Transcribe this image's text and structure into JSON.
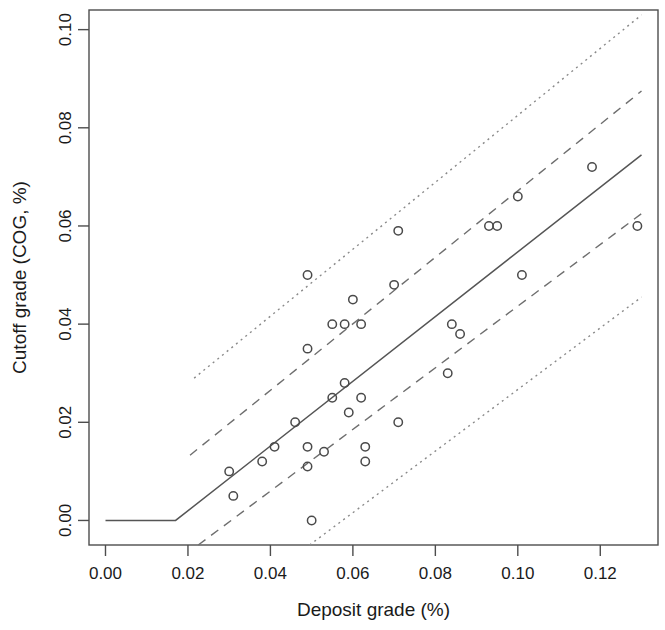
{
  "chart_data": {
    "type": "scatter",
    "title": "",
    "xlabel": "Deposit grade (%)",
    "ylabel": "Cutoff grade (COG, %)",
    "xlim": [
      -0.004,
      0.134
    ],
    "ylim": [
      -0.005,
      0.104
    ],
    "xticks": [
      0.0,
      0.02,
      0.04,
      0.06,
      0.08,
      0.1,
      0.12
    ],
    "xtick_labels": [
      "0.00",
      "0.02",
      "0.04",
      "0.06",
      "0.08",
      "0.10",
      "0.12"
    ],
    "yticks": [
      0.0,
      0.02,
      0.04,
      0.06,
      0.08,
      0.1
    ],
    "ytick_labels": [
      "0.00",
      "0.02",
      "0.04",
      "0.06",
      "0.08",
      "0.10"
    ],
    "grid": false,
    "legend": "none",
    "marker": "open-circle",
    "points": [
      {
        "x": 0.03,
        "y": 0.01
      },
      {
        "x": 0.031,
        "y": 0.005
      },
      {
        "x": 0.038,
        "y": 0.012
      },
      {
        "x": 0.041,
        "y": 0.015
      },
      {
        "x": 0.046,
        "y": 0.02
      },
      {
        "x": 0.049,
        "y": 0.05
      },
      {
        "x": 0.049,
        "y": 0.035
      },
      {
        "x": 0.049,
        "y": 0.015
      },
      {
        "x": 0.049,
        "y": 0.011
      },
      {
        "x": 0.05,
        "y": 0.0
      },
      {
        "x": 0.053,
        "y": 0.014
      },
      {
        "x": 0.055,
        "y": 0.04
      },
      {
        "x": 0.055,
        "y": 0.025
      },
      {
        "x": 0.058,
        "y": 0.04
      },
      {
        "x": 0.058,
        "y": 0.028
      },
      {
        "x": 0.059,
        "y": 0.022
      },
      {
        "x": 0.06,
        "y": 0.045
      },
      {
        "x": 0.062,
        "y": 0.04
      },
      {
        "x": 0.062,
        "y": 0.025
      },
      {
        "x": 0.063,
        "y": 0.015
      },
      {
        "x": 0.063,
        "y": 0.012
      },
      {
        "x": 0.07,
        "y": 0.048
      },
      {
        "x": 0.071,
        "y": 0.059
      },
      {
        "x": 0.071,
        "y": 0.02
      },
      {
        "x": 0.083,
        "y": 0.03
      },
      {
        "x": 0.084,
        "y": 0.04
      },
      {
        "x": 0.086,
        "y": 0.038
      },
      {
        "x": 0.093,
        "y": 0.06
      },
      {
        "x": 0.095,
        "y": 0.06
      },
      {
        "x": 0.1,
        "y": 0.066
      },
      {
        "x": 0.101,
        "y": 0.05
      },
      {
        "x": 0.118,
        "y": 0.072
      },
      {
        "x": 0.129,
        "y": 0.06
      }
    ],
    "fit_line": {
      "style": "solid",
      "label": "regression fit",
      "points": [
        {
          "x": 0.0,
          "y": 0.0
        },
        {
          "x": 0.017,
          "y": 0.0
        },
        {
          "x": 0.13,
          "y": 0.0745
        }
      ]
    },
    "confidence_band": {
      "style": "dashed",
      "label": "confidence interval",
      "upper": [
        {
          "x": 0.0205,
          "y": 0.0133
        },
        {
          "x": 0.13,
          "y": 0.0875
        }
      ],
      "lower": [
        {
          "x": 0.0225,
          "y": -0.005
        },
        {
          "x": 0.13,
          "y": 0.0625
        }
      ]
    },
    "prediction_band": {
      "style": "dotted",
      "label": "prediction interval",
      "upper": [
        {
          "x": 0.0215,
          "y": 0.029
        },
        {
          "x": 0.13,
          "y": 0.103
        }
      ],
      "lower": [
        {
          "x": 0.0495,
          "y": -0.005
        },
        {
          "x": 0.13,
          "y": 0.0455
        }
      ]
    }
  },
  "figure": {
    "background_color": "#ffffff",
    "axis_color": "#4d4d4d",
    "point_color": "#4a4a4a",
    "fit_color": "#555555",
    "band_dashed_color": "#6e6e6e",
    "band_dotted_color": "#8a8a8a"
  }
}
